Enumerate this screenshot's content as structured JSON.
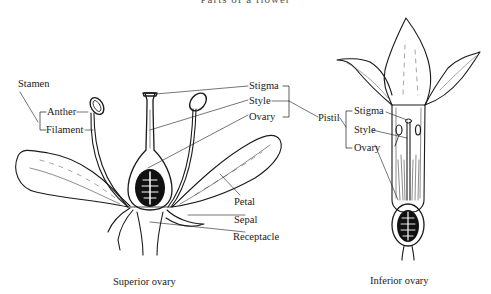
{
  "figure": {
    "title": "Parts of a flower",
    "colors": {
      "ink": "#1a1a1a",
      "background": "#ffffff",
      "fill_dark": "#111111"
    }
  },
  "superior_flower": {
    "caption": "Superior ovary",
    "labels": {
      "stamen": "Stamen",
      "anther": "Anther",
      "filament": "Filament",
      "stigma": "Stigma",
      "style": "Style",
      "ovary": "Ovary",
      "pistil": "Pistil",
      "petal": "Petal",
      "sepal": "Sepal",
      "receptacle": "Receptacle"
    }
  },
  "inferior_flower": {
    "caption": "Inferior ovary",
    "labels": {
      "stigma": "Stigma",
      "style": "Style",
      "ovary": "Ovary"
    }
  }
}
